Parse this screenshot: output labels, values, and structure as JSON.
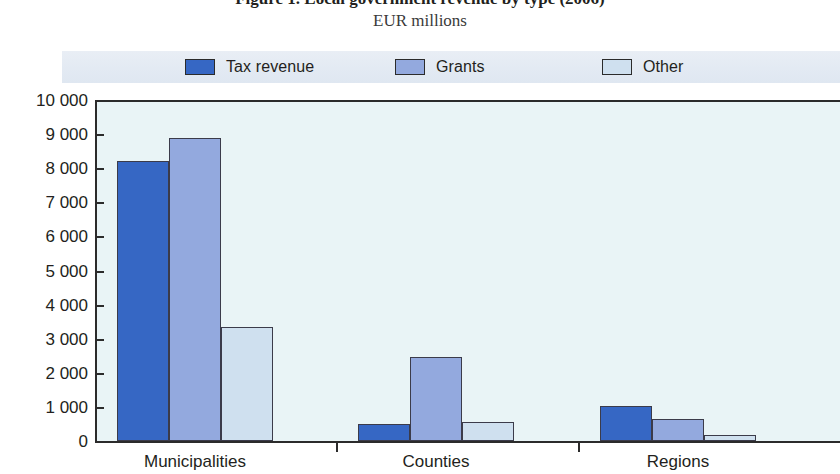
{
  "figure": {
    "caption": "Figure 1. Local government revenue by type (2006)",
    "subtitle": "EUR millions"
  },
  "legend": {
    "items": [
      {
        "label": "Tax revenue",
        "color": "#3667c4"
      },
      {
        "label": "Grants",
        "color": "#93a9de"
      },
      {
        "label": "Other",
        "color": "#cfe0ef"
      }
    ]
  },
  "axis": {
    "y_ticks": [
      "10 000",
      "9 000",
      "8 000",
      "7 000",
      "6 000",
      "5 000",
      "4 000",
      "3 000",
      "2 000",
      "1 000",
      "0"
    ],
    "x_categories": [
      "Municipalities",
      "Counties",
      "Regions"
    ]
  },
  "chart_data": {
    "type": "bar",
    "title": "Figure 1. Local government revenue by type (2006)",
    "subtitle": "EUR millions",
    "xlabel": "",
    "ylabel": "EUR millions",
    "ylim": [
      0,
      10000
    ],
    "ytick_step": 1000,
    "grid": false,
    "legend_position": "top",
    "categories": [
      "Municipalities",
      "Counties",
      "Regions"
    ],
    "series": [
      {
        "name": "Tax revenue",
        "color": "#3667c4",
        "values": [
          8200,
          500,
          1020
        ]
      },
      {
        "name": "Grants",
        "color": "#93a9de",
        "values": [
          8900,
          2450,
          660
        ]
      },
      {
        "name": "Other",
        "color": "#cfe0ef",
        "values": [
          3330,
          560,
          170
        ]
      }
    ]
  }
}
